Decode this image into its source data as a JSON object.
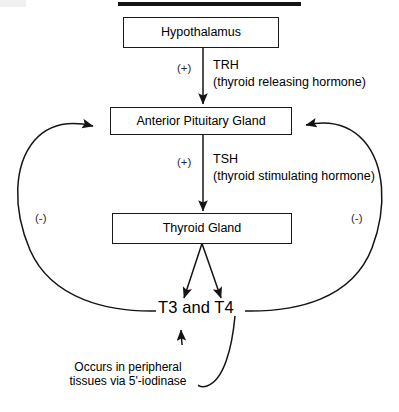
{
  "diagram": {
    "title_rule": "",
    "nodes": [
      {
        "id": "hypothalamus",
        "label": "Hypothalamus"
      },
      {
        "id": "anterior-pituitary-gland",
        "label": "Anterior Pituitary Gland"
      },
      {
        "id": "thyroid-gland",
        "label": "Thyroid Gland"
      },
      {
        "id": "t3-t4",
        "label": "T3 and T4"
      }
    ],
    "edges": [
      {
        "id": "hypothalamus-to-pituitary",
        "sign": "(+)",
        "abbrev": "TRH",
        "expansion": "(thyroid releasing hormone)"
      },
      {
        "id": "pituitary-to-thyroid",
        "sign": "(+)",
        "abbrev": "TSH",
        "expansion": "(thyroid stimulating hormone)"
      },
      {
        "id": "feedback-left",
        "sign": "(-)"
      },
      {
        "id": "feedback-right",
        "sign": "(-)"
      }
    ],
    "annotations": [
      {
        "id": "conversion-note",
        "text": "Occurs in peripheral\ntissues via 5'-iodinase"
      }
    ],
    "colors": {
      "stroke": "#1a1a1a",
      "text": "#000000",
      "background": "#ffffff",
      "rule": "#141414"
    }
  }
}
